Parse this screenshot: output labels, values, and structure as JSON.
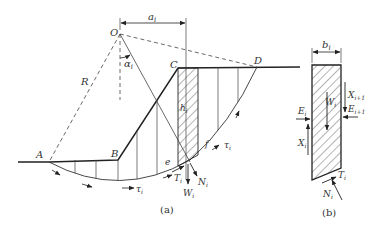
{
  "figure": {
    "part_a": {
      "caption": "(a)",
      "points": {
        "O": "O",
        "A": "A",
        "B": "B",
        "C": "C",
        "D": "D",
        "e": "e",
        "f": "f"
      },
      "labels": {
        "radius": "R",
        "moment_arm": "a",
        "moment_arm_sub": "i",
        "angle": "α",
        "angle_sub": "i",
        "slice_height": "h",
        "slice_height_sub": "i",
        "shear_stress_1": "τ",
        "shear_stress_1_sub": "i",
        "shear_stress_2": "τ",
        "shear_stress_2_sub": "i",
        "shear_force": "T",
        "shear_force_sub": "i",
        "normal_force": "N",
        "normal_force_sub": "i",
        "weight": "W",
        "weight_sub": "i"
      }
    },
    "part_b": {
      "caption": "(b)",
      "labels": {
        "width": "b",
        "width_sub": "i",
        "weight": "W",
        "weight_sub": "i",
        "left_normal": "E",
        "left_normal_sub": "i",
        "left_shear": "X",
        "left_shear_sub": "i",
        "right_shear": "X",
        "right_shear_sub": "i+1",
        "right_normal": "E",
        "right_normal_sub": "i+1",
        "base_shear": "T",
        "base_shear_sub": "i",
        "base_normal": "N",
        "base_normal_sub": "i"
      }
    },
    "colors": {
      "line": "#222222",
      "thin": "#444444",
      "text": "#333333",
      "background": "#ffffff"
    }
  }
}
